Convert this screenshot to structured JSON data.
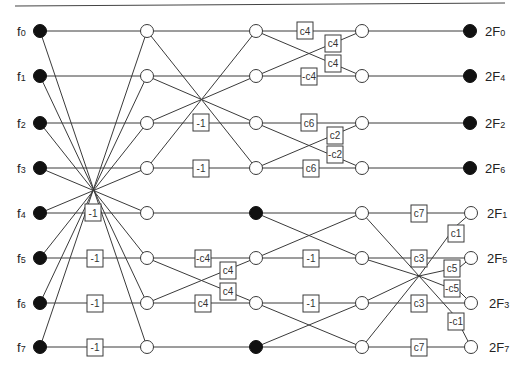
{
  "diagram": {
    "inputs": [
      {
        "base": "f",
        "sub": "0"
      },
      {
        "base": "f",
        "sub": "1"
      },
      {
        "base": "f",
        "sub": "2"
      },
      {
        "base": "f",
        "sub": "3"
      },
      {
        "base": "f",
        "sub": "4"
      },
      {
        "base": "f",
        "sub": "5"
      },
      {
        "base": "f",
        "sub": "6"
      },
      {
        "base": "f",
        "sub": "7"
      }
    ],
    "outputs": [
      {
        "base": "2F",
        "sub": "0"
      },
      {
        "base": "2F",
        "sub": "4"
      },
      {
        "base": "2F",
        "sub": "2"
      },
      {
        "base": "2F",
        "sub": "6"
      },
      {
        "base": "2F",
        "sub": "1"
      },
      {
        "base": "2F",
        "sub": "5"
      },
      {
        "base": "2F",
        "sub": "3"
      },
      {
        "base": "2F",
        "sub": "7"
      }
    ],
    "stage1_boxes": [
      "-1",
      "-1",
      "-1",
      "-1"
    ],
    "stage2_boxes": [
      "-1",
      "-1",
      "-c4",
      "c4",
      "c4",
      "c4"
    ],
    "stage3_boxes": [
      "c4",
      "c4",
      "c4",
      "-c4",
      "c6",
      "c2",
      "-c2",
      "c6",
      "-1",
      "-1"
    ],
    "stage4_boxes": [
      "c7",
      "c1",
      "c3",
      "c5",
      "-c5",
      "c3",
      "-c1",
      "c7"
    ],
    "colors": {
      "line": "#3a3a3a",
      "filled_node": "#111111",
      "open_node": "#ffffff"
    }
  }
}
